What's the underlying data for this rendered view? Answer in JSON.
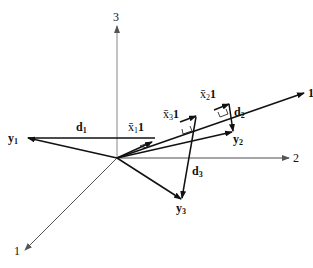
{
  "diagram": {
    "axes": [
      {
        "id": "axis-3",
        "label": "3"
      },
      {
        "id": "axis-2",
        "label": "2"
      },
      {
        "id": "axis-1",
        "label": "1"
      }
    ],
    "vectors": {
      "one": {
        "label": "1"
      },
      "y1": {
        "label": "y",
        "sub": "1"
      },
      "y2": {
        "label": "y",
        "sub": "2"
      },
      "y3": {
        "label": "y",
        "sub": "3"
      },
      "d1": {
        "label": "d",
        "sub": "1"
      },
      "d2": {
        "label": "d",
        "sub": "2"
      },
      "d3": {
        "label": "d",
        "sub": "3"
      }
    },
    "projections": [
      {
        "id": "x1",
        "bar": "x̄",
        "sub": "1",
        "suffix": "1"
      },
      {
        "id": "x2",
        "bar": "x̄",
        "sub": "2",
        "suffix": "1"
      },
      {
        "id": "x3",
        "bar": "x̄",
        "sub": "3",
        "suffix": "1"
      }
    ],
    "colors": {
      "axis": "#888888",
      "vector": "#111111",
      "background": "#ffffff"
    }
  }
}
